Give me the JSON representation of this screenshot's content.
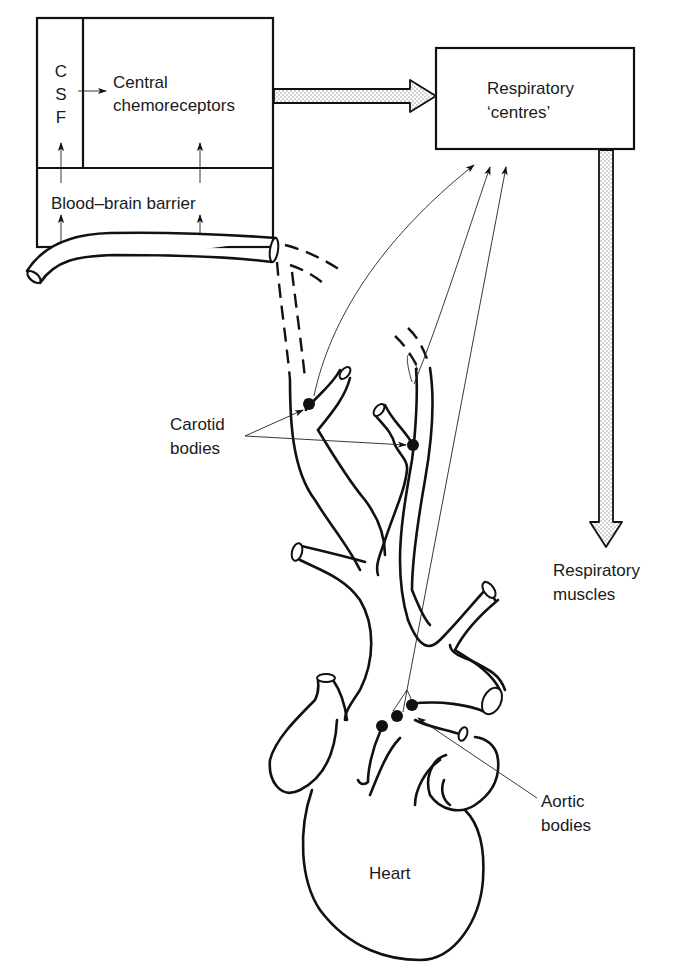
{
  "diagram": {
    "type": "physiology-flow-diagram",
    "boxes": {
      "csf": {
        "label_lines": [
          "C",
          "S",
          "F"
        ]
      },
      "central_chemoreceptors": {
        "label_lines": [
          "Central",
          "chemoreceptors"
        ]
      },
      "blood_brain_barrier": {
        "label": "Blood–brain barrier"
      },
      "respiratory_centres": {
        "label_lines": [
          "Respiratory",
          "‘centres’"
        ]
      }
    },
    "labels": {
      "respiratory_muscles": [
        "Respiratory",
        "muscles"
      ],
      "carotid_bodies": [
        "Carotid",
        "bodies"
      ],
      "aortic_bodies": [
        "Aortic",
        "bodies"
      ],
      "heart": "Heart"
    },
    "flows": [
      {
        "from": "CSF",
        "to": "Central chemoreceptors",
        "style": "thin-arrow"
      },
      {
        "from": "Blood vessel",
        "to": "Blood–brain barrier",
        "style": "thin-arrow"
      },
      {
        "from": "Central chemoreceptors",
        "to": "Respiratory 'centres'",
        "style": "stippled-block-arrow"
      },
      {
        "from": "Respiratory 'centres'",
        "to": "Respiratory muscles",
        "style": "stippled-block-arrow"
      },
      {
        "from": "Carotid bodies",
        "to": "Respiratory 'centres'",
        "style": "thin-nerve-arrow"
      },
      {
        "from": "Aortic bodies",
        "to": "Respiratory 'centres'",
        "style": "thin-nerve-arrow"
      }
    ],
    "colors": {
      "ink": "#111111",
      "background": "#ffffff",
      "stipple": "#9a9a9a"
    }
  }
}
